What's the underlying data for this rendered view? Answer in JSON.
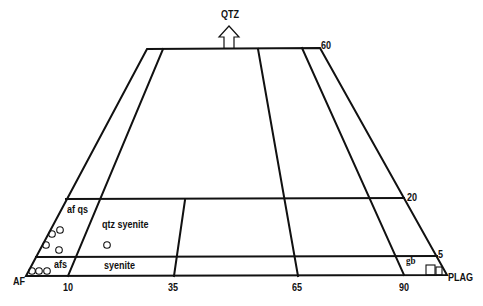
{
  "diagram": {
    "type": "QAPF (truncated QAP triangle, Q 0-60)",
    "apices": {
      "top": "QTZ",
      "left": "AF",
      "right": "PLAG"
    },
    "q_ticks": [
      "60",
      "20",
      "5"
    ],
    "p_ticks": [
      "10",
      "35",
      "65",
      "90"
    ],
    "fields": [
      {
        "id": "af_qs",
        "label": "af qs"
      },
      {
        "id": "qtz_syenite",
        "label": "qtz  syenite"
      },
      {
        "id": "afs",
        "label": "afs"
      },
      {
        "id": "syenite",
        "label": "syenite"
      },
      {
        "id": "gb",
        "label": "gb"
      }
    ],
    "symbols": {
      "circle": "open circle sample",
      "square": "open square sample"
    },
    "samples_circles": [
      {
        "x": 60,
        "y": 230
      },
      {
        "x": 52,
        "y": 234
      },
      {
        "x": 46,
        "y": 245
      },
      {
        "x": 59,
        "y": 250
      },
      {
        "x": 107,
        "y": 245
      },
      {
        "x": 32,
        "y": 270
      },
      {
        "x": 38,
        "y": 270
      },
      {
        "x": 47,
        "y": 270
      }
    ],
    "samples_squares": [
      {
        "x": 426,
        "y": 264,
        "w": 9,
        "h": 10
      },
      {
        "x": 436,
        "y": 266,
        "w": 6,
        "h": 8
      }
    ]
  }
}
